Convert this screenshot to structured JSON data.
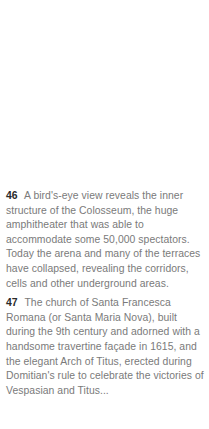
{
  "captions": [
    {
      "number": "46",
      "text": "A bird's-eye view reveals the inner structure of the Colosseum, the huge amphitheater that was able to accommodate some 50,000 spectators. Today the arena and many of the terraces have collapsed, revealing the corridors, cells and other underground areas."
    },
    {
      "number": "47",
      "text": "The church of Santa Francesca Romana (or Santa Maria Nova), built during the 9th century and adorned with a handsome travertine façade in 1615, and the elegant Arch of Titus, erected during Domitian's rule to celebrate the victories of Vespasian and Titus..."
    }
  ]
}
